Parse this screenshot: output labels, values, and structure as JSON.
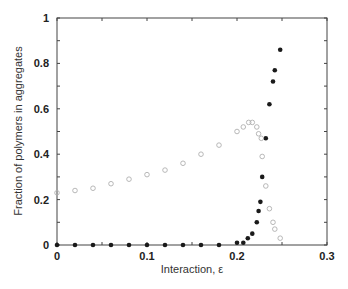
{
  "chart_data": {
    "type": "scatter",
    "title": "",
    "xlabel": "Interaction, ε",
    "ylabel": "Fraction of polymers in aggregates",
    "xlim": [
      0,
      0.3
    ],
    "ylim": [
      0,
      1
    ],
    "xticks": [
      0,
      0.1,
      0.2,
      0.3
    ],
    "xtick_labels": [
      "0",
      "0.1",
      "0.2",
      "0.3"
    ],
    "yticks": [
      0,
      0.2,
      0.4,
      0.6,
      0.8,
      1
    ],
    "ytick_labels": [
      "0",
      "0.2",
      "0.4",
      "0.6",
      "0.8",
      "1"
    ],
    "grid": false,
    "legend": null,
    "series": [
      {
        "name": "filled circles",
        "marker": "filled-circle",
        "color": "#1a1a1a",
        "x": [
          0,
          0.02,
          0.04,
          0.06,
          0.08,
          0.1,
          0.12,
          0.14,
          0.16,
          0.18,
          0.2,
          0.207,
          0.212,
          0.217,
          0.222,
          0.224,
          0.226,
          0.228,
          0.232,
          0.236,
          0.24,
          0.242,
          0.248
        ],
        "y": [
          0,
          0,
          0,
          0,
          0,
          0,
          0,
          0,
          0,
          0,
          0.01,
          0.01,
          0.03,
          0.05,
          0.1,
          0.15,
          0.19,
          0.3,
          0.47,
          0.62,
          0.72,
          0.77,
          0.86
        ]
      },
      {
        "name": "open circles",
        "marker": "open-circle",
        "color": "#b0b0b0",
        "x": [
          0,
          0.02,
          0.04,
          0.06,
          0.08,
          0.1,
          0.12,
          0.14,
          0.16,
          0.18,
          0.2,
          0.207,
          0.213,
          0.217,
          0.222,
          0.224,
          0.227,
          0.228,
          0.232,
          0.236,
          0.24,
          0.242,
          0.248
        ],
        "y": [
          0.23,
          0.24,
          0.25,
          0.27,
          0.29,
          0.31,
          0.33,
          0.36,
          0.4,
          0.44,
          0.5,
          0.52,
          0.54,
          0.54,
          0.52,
          0.49,
          0.47,
          0.39,
          0.26,
          0.16,
          0.1,
          0.07,
          0.03
        ]
      }
    ]
  }
}
